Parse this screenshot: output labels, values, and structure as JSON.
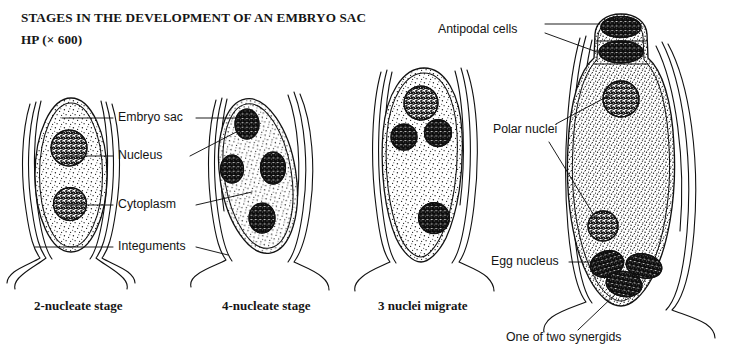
{
  "figure": {
    "title_main": "STAGES IN THE DEVELOPMENT OF AN EMBRYO SAC",
    "title_magnification": "HP (× 600)",
    "ink_color": "#111111",
    "background_color": "#ffffff"
  },
  "callouts": {
    "embryo_sac": "Embryo sac",
    "nucleus": "Nucleus",
    "cytoplasm": "Cytoplasm",
    "integuments": "Integuments",
    "antipodal_cells": "Antipodal cells",
    "polar_nuclei": "Polar nuclei",
    "egg_nucleus": "Egg nucleus",
    "one_of_two_synergids": "One of two synergids"
  },
  "stages": [
    {
      "id": "two-nucleate",
      "caption": "2-nucleate stage",
      "nuclei_count": 2
    },
    {
      "id": "four-nucleate",
      "caption": "4-nucleate stage",
      "nuclei_count": 4
    },
    {
      "id": "three-nuclei-migrate",
      "caption": "3 nuclei migrate",
      "nuclei_count": 4
    },
    {
      "id": "mature-embryo-sac",
      "caption": "",
      "nuclei_count": 7
    }
  ]
}
